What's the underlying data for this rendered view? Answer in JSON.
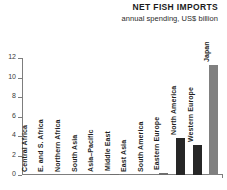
{
  "header": {
    "title": "NET FISH IMPORTS",
    "subtitle": "annual spending, US$ billion"
  },
  "chart_data": {
    "type": "bar",
    "title": "NET FISH IMPORTS",
    "subtitle": "annual spending, US$ billion",
    "xlabel": "",
    "ylabel": "",
    "ylim": [
      0,
      12
    ],
    "yticks": [
      "0",
      "2",
      "4",
      "6",
      "8",
      "10",
      "12"
    ],
    "ytick_values": [
      0,
      2,
      4,
      6,
      8,
      10,
      12
    ],
    "grid": false,
    "legend": "none",
    "categories": [
      "Central Africa",
      "E. and S. Africa",
      "Northern Africa",
      "South Asia",
      "Asia–Pacific",
      "Middle East",
      "East Asia",
      "South America",
      "Eastern Europe",
      "North America",
      "Western Europe",
      "Japan"
    ],
    "values": [
      0,
      0,
      0,
      0,
      0,
      0.05,
      0,
      0,
      0.2,
      3.8,
      3.05,
      11.3
    ],
    "bar_colors": [
      "#6e6e6e",
      "#6e6e6e",
      "#6e6e6e",
      "#6e6e6e",
      "#6e6e6e",
      "#6e6e6e",
      "#6e6e6e",
      "#6e6e6e",
      "#6e6e6e",
      "#262626",
      "#262626",
      "#808080"
    ]
  }
}
